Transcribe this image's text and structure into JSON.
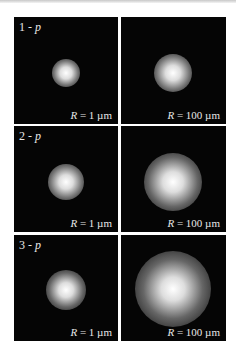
{
  "rows": [
    {
      "label_num": "1 - ",
      "label_var": "p",
      "panels": [
        {
          "r_var": "R",
          "r_text": " = 1 µm",
          "spot_size": 26
        },
        {
          "r_var": "R",
          "r_text": " = 100 µm",
          "spot_size": 34
        }
      ]
    },
    {
      "label_num": "2 - ",
      "label_var": "p",
      "panels": [
        {
          "r_var": "R",
          "r_text": " = 1 µm",
          "spot_size": 34
        },
        {
          "r_var": "R",
          "r_text": " = 100 µm",
          "spot_size": 56
        }
      ]
    },
    {
      "label_num": "3 - ",
      "label_var": "p",
      "panels": [
        {
          "r_var": "R",
          "r_text": " = 1 µm",
          "spot_size": 38
        },
        {
          "r_var": "R",
          "r_text": " = 100 µm",
          "spot_size": 72
        }
      ]
    }
  ]
}
